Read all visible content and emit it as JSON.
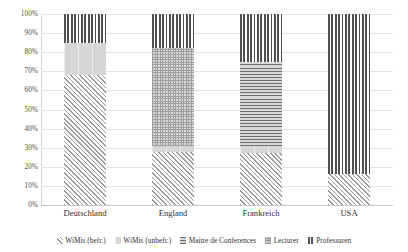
{
  "chart_data": {
    "type": "bar",
    "subtype": "100% stacked column",
    "title": "",
    "xlabel": "",
    "ylabel": "",
    "categories": [
      "Deutschland",
      "England",
      "Frankreich",
      "USA"
    ],
    "ylim": [
      0,
      100
    ],
    "ytick_labels": [
      "0%",
      "10%",
      "20%",
      "30%",
      "40%",
      "50%",
      "60%",
      "70%",
      "80%",
      "90%",
      "100%"
    ],
    "ytick_values": [
      0,
      10,
      20,
      30,
      40,
      50,
      60,
      70,
      80,
      90,
      100
    ],
    "grid": true,
    "legend_position": "bottom",
    "series": [
      {
        "name": "WiMis (befr.)",
        "pattern": "diagonal-hatch",
        "values": [
          68,
          28,
          27,
          16
        ]
      },
      {
        "name": "WiMis (unbefr.)",
        "pattern": "solid-light-gray",
        "values": [
          17,
          3,
          4,
          0
        ]
      },
      {
        "name": "Maitre de Conferences",
        "pattern": "horizontal-lines",
        "values": [
          0,
          0,
          44,
          0
        ]
      },
      {
        "name": "Lecturer",
        "pattern": "checker-dots",
        "values": [
          0,
          51,
          0,
          0
        ]
      },
      {
        "name": "Professuren",
        "pattern": "vertical-lines",
        "values": [
          15,
          18,
          25,
          84
        ]
      }
    ]
  }
}
